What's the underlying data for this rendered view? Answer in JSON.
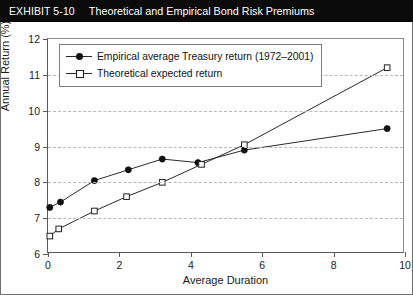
{
  "header": {
    "exhibit_label": "EXHIBIT 5-10",
    "title": "Theoretical and Empirical Bond Risk Premiums",
    "bg_color": "#0b0b0b",
    "text_color": "#ffffff"
  },
  "chart_data": {
    "type": "line",
    "title": "Theoretical and Empirical Bond Risk Premiums",
    "xlabel": "Average Duration",
    "ylabel": "Annual Return (%)",
    "xlim": [
      0,
      10
    ],
    "ylim": [
      6,
      12
    ],
    "xticks": [
      0,
      2,
      4,
      6,
      8,
      10
    ],
    "yticks": [
      6,
      7,
      8,
      9,
      10,
      11,
      12
    ],
    "xtick_labels": [
      "0",
      "2",
      "4",
      "6",
      "8",
      "10"
    ],
    "ytick_labels": [
      "6",
      "7",
      "8",
      "9",
      "10",
      "11",
      "12"
    ],
    "grid": "horizontal-dashed",
    "legend_position": "upper-left-inside",
    "series": [
      {
        "name": "Empirical average Treasury return (1972–2001)",
        "marker": "filled-circle",
        "color": "#111111",
        "x": [
          0.05,
          0.35,
          1.3,
          2.25,
          3.2,
          4.2,
          5.5,
          9.5
        ],
        "y": [
          7.3,
          7.45,
          8.05,
          8.35,
          8.65,
          8.55,
          8.9,
          9.5
        ]
      },
      {
        "name": "Theoretical expected return",
        "marker": "open-square",
        "color": "#222222",
        "x": [
          0.05,
          0.3,
          1.3,
          2.2,
          3.2,
          4.3,
          5.5,
          9.5
        ],
        "y": [
          6.5,
          6.7,
          7.2,
          7.6,
          8.0,
          8.5,
          9.05,
          11.2
        ]
      }
    ]
  },
  "legend": {
    "items": [
      {
        "label": "Empirical average Treasury return (1972–2001)",
        "marker": "filled-circle"
      },
      {
        "label": "Theoretical expected return",
        "marker": "open-square"
      }
    ]
  }
}
